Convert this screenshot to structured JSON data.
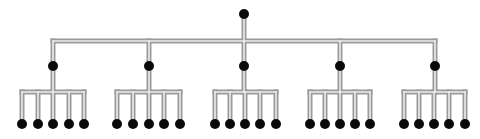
{
  "diagram": {
    "type": "tree",
    "colors": {
      "node": "#0a0a0a",
      "connector_outline": "#9a9a9a",
      "connector_fill": "#ececec",
      "background": "#ffffff"
    },
    "root": {
      "x": 244,
      "y": 14
    },
    "main_bar_y": 41,
    "level1_y": 66,
    "sub_bar_y": 92,
    "leaf_y": 124,
    "children": [
      {
        "x": 53,
        "leaves": [
          22,
          38,
          53,
          69,
          84
        ]
      },
      {
        "x": 149,
        "leaves": [
          117,
          133,
          149,
          164,
          180
        ]
      },
      {
        "x": 244,
        "leaves": [
          215,
          230,
          245,
          260,
          276
        ]
      },
      {
        "x": 340,
        "leaves": [
          310,
          325,
          340,
          355,
          370
        ]
      },
      {
        "x": 435,
        "leaves": [
          404,
          419,
          434,
          449,
          465
        ]
      }
    ]
  }
}
